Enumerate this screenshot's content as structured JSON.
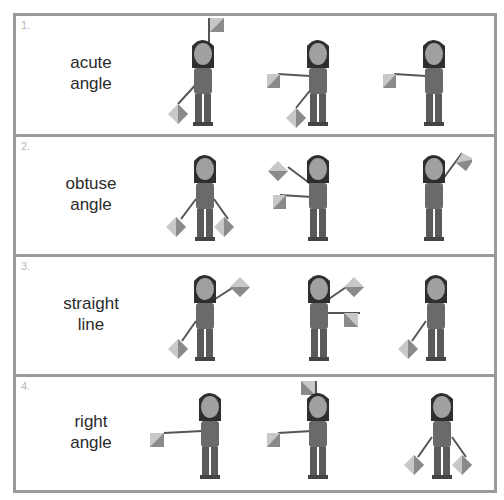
{
  "rows": [
    {
      "number": "1.",
      "label_line1": "acute",
      "label_line2": "angle",
      "poses": [
        "up-high + lower-left",
        "left-horizontal + lower-left",
        "left-horizontal + down"
      ]
    },
    {
      "number": "2.",
      "label_line1": "obtuse",
      "label_line2": "angle",
      "poses": [
        "lower-left + lower-right",
        "upper-left + left-horizontal",
        "upper-right + down"
      ]
    },
    {
      "number": "3.",
      "label_line1": "straight",
      "label_line2": "line",
      "poses": [
        "lower-left + upper-right",
        "upper-right + right-horizontal",
        "lower-left + down"
      ]
    },
    {
      "number": "4.",
      "label_line1": "right",
      "label_line2": "angle",
      "poses": [
        "left-horizontal + down",
        "left-horizontal + up",
        "lower-left + lower-right"
      ]
    }
  ],
  "colors": {
    "border": "#9a9a9a",
    "label_text": "#2b2b2b",
    "number_text": "#b8b8b8",
    "flag_light": "#c8c8c8",
    "flag_dark": "#8a8a8a"
  }
}
